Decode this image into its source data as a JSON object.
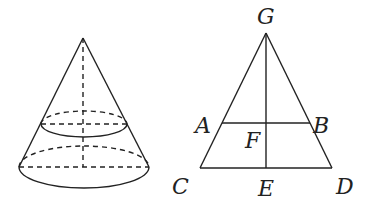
{
  "figure_left": {
    "type": "cone",
    "description": "Cone cut by a plane parallel to the base, with dashed axis and hidden edges"
  },
  "figure_right": {
    "type": "axial-section",
    "labels": {
      "G": "G",
      "A": "A",
      "B": "B",
      "F": "F",
      "C": "C",
      "E": "E",
      "D": "D"
    }
  },
  "colors": {
    "stroke": "#222222",
    "background": "#ffffff"
  }
}
